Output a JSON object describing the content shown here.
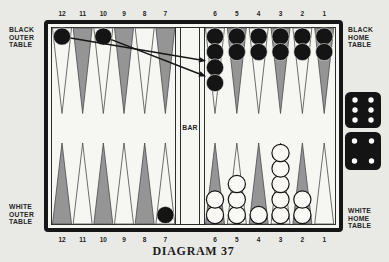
{
  "diagram": {
    "caption": "DIAGRAM 37",
    "bar_label": "BAR",
    "labels": {
      "black_outer": "BLACK\nOUTER\nTABLE",
      "black_home": "BLACK\nHOME\nTABLE",
      "white_outer": "WHITE\nOUTER\nTABLE",
      "white_home": "WHITE\nHOME\nTABLE"
    }
  },
  "board": {
    "top_points": [
      {
        "number": "12",
        "shaded": false,
        "checkers": 1,
        "checker_color": "black"
      },
      {
        "number": "11",
        "shaded": true,
        "checkers": 0,
        "checker_color": ""
      },
      {
        "number": "10",
        "shaded": false,
        "checkers": 1,
        "checker_color": "black"
      },
      {
        "number": "9",
        "shaded": true,
        "checkers": 0,
        "checker_color": ""
      },
      {
        "number": "8",
        "shaded": false,
        "checkers": 0,
        "checker_color": ""
      },
      {
        "number": "7",
        "shaded": true,
        "checkers": 0,
        "checker_color": ""
      },
      {
        "number": "6",
        "shaded": false,
        "checkers": 4,
        "checker_color": "black"
      },
      {
        "number": "5",
        "shaded": true,
        "checkers": 2,
        "checker_color": "black"
      },
      {
        "number": "4",
        "shaded": false,
        "checkers": 2,
        "checker_color": "black"
      },
      {
        "number": "3",
        "shaded": true,
        "checkers": 2,
        "checker_color": "black"
      },
      {
        "number": "2",
        "shaded": false,
        "checkers": 2,
        "checker_color": "black"
      },
      {
        "number": "1",
        "shaded": true,
        "checkers": 2,
        "checker_color": "black"
      }
    ],
    "bottom_points": [
      {
        "number": "12",
        "shaded": true,
        "checkers": 0,
        "checker_color": ""
      },
      {
        "number": "11",
        "shaded": false,
        "checkers": 0,
        "checker_color": ""
      },
      {
        "number": "10",
        "shaded": true,
        "checkers": 0,
        "checker_color": ""
      },
      {
        "number": "9",
        "shaded": false,
        "checkers": 0,
        "checker_color": ""
      },
      {
        "number": "8",
        "shaded": true,
        "checkers": 0,
        "checker_color": ""
      },
      {
        "number": "7",
        "shaded": false,
        "checkers": 1,
        "checker_color": "black"
      },
      {
        "number": "6",
        "shaded": true,
        "checkers": 2,
        "checker_color": "white"
      },
      {
        "number": "5",
        "shaded": false,
        "checkers": 3,
        "checker_color": "white"
      },
      {
        "number": "4",
        "shaded": true,
        "checkers": 1,
        "checker_color": "white"
      },
      {
        "number": "3",
        "shaded": false,
        "checkers": 5,
        "checker_color": "white"
      },
      {
        "number": "2",
        "shaded": true,
        "checkers": 2,
        "checker_color": "white"
      },
      {
        "number": "1",
        "shaded": false,
        "checkers": 0,
        "checker_color": ""
      }
    ],
    "move_arrows": [
      {
        "from_point": "12",
        "to_point": "6",
        "to_stack_position": 3
      },
      {
        "from_point": "10",
        "to_point": "6",
        "to_stack_position": 4
      }
    ],
    "dice": [
      6,
      4
    ]
  },
  "colors": {
    "paper": "#e9eae6",
    "field": "#f6f6f2",
    "shaded_point": "#959595",
    "open_point": "#f6f6f2",
    "line": "#161616",
    "triangle_outline": "#4a4a4a",
    "checker_black": "#141414",
    "checker_white": "#faf9f5",
    "die": "#141414",
    "pip": "#ffffff"
  }
}
